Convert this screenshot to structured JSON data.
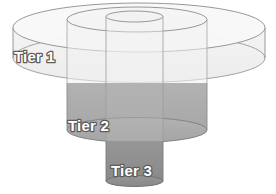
{
  "diagram": {
    "type": "nested-cylinder-tier-diagram",
    "title": "",
    "background_color": "#ffffff",
    "label_text_color": "#ffffff",
    "label_outline_color": "#5c5c5c",
    "outline_color": "#8c8c8c",
    "tiers": [
      {
        "id": "tier-1",
        "label": "Tier 1",
        "level": 1,
        "fill_color": "#f1f1f1",
        "top_fill_color": "#f7f7f7",
        "label_x": 48,
        "label_y": 58,
        "cx": 139,
        "rx": 126,
        "top_cy": 27.5,
        "ry": 24.5,
        "bottom_cy": 58,
        "body_bottom": 83
      },
      {
        "id": "tier-2",
        "label": "Tier 2",
        "level": 2,
        "fill_color": "#ababab",
        "top_fill_color": "#f4f4f4",
        "label_x": 68,
        "label_y": 127,
        "cx": 137,
        "rx": 70,
        "top_cy": 19.5,
        "ry": 12.5,
        "bottom_cy": 130,
        "body_bottom": 130
      },
      {
        "id": "tier-3",
        "label": "Tier 3",
        "level": 3,
        "fill_color": "#8f8f8f",
        "top_fill_color": "#f2f2f2",
        "label_x": 111,
        "label_y": 172,
        "cx": 134.5,
        "rx": 28.5,
        "top_cy": 16.5,
        "ry": 5.5,
        "bottom_cy": 181,
        "body_bottom": 181
      }
    ]
  }
}
